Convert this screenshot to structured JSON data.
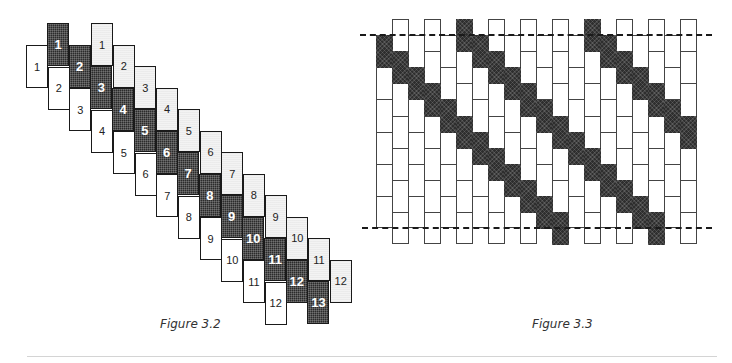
{
  "figures": [
    {
      "id": "fig-3-2",
      "caption": "Figure 3.2",
      "type": "staggered-numbered-cells",
      "columns": [
        {
          "name": "white",
          "shade": "white",
          "labels": [
            "1",
            "2",
            "3",
            "4",
            "5",
            "6",
            "7",
            "8",
            "9",
            "10",
            "11",
            "12"
          ]
        },
        {
          "name": "dark",
          "shade": "dark",
          "labels": [
            "1",
            "2",
            "3",
            "4",
            "5",
            "6",
            "7",
            "8",
            "9",
            "10",
            "11",
            "12",
            "13"
          ]
        },
        {
          "name": "light",
          "shade": "light",
          "labels": [
            "1",
            "2",
            "3",
            "4",
            "5",
            "6",
            "7",
            "8",
            "9",
            "10",
            "11",
            "12"
          ]
        }
      ]
    },
    {
      "id": "fig-3-3",
      "caption": "Figure 3.3",
      "type": "brick-grid-with-diagonals",
      "column_count": 20,
      "short_column_cells": 6,
      "tall_column_cells": 7,
      "dashed_lines": [
        "top",
        "bottom"
      ],
      "diagonals": [
        {
          "start_column": 1,
          "end_column": 12
        },
        {
          "start_column": 6,
          "end_column": 18
        },
        {
          "start_column": 14,
          "end_column": 20
        }
      ]
    }
  ],
  "colors": {
    "dark_cell": "#2b2b2b",
    "light_cell": "#f3f3f3",
    "border": "#1a1a1a",
    "rule": "#d4d4d4"
  }
}
